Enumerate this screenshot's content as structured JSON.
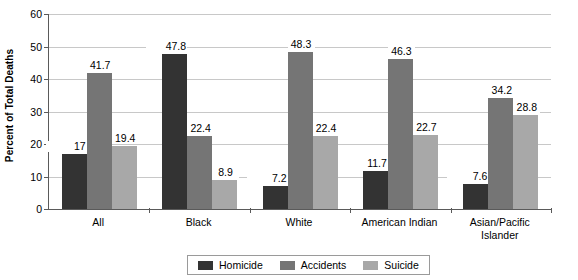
{
  "chart_data": {
    "type": "bar",
    "title": "",
    "subtitle": "",
    "xlabel": "",
    "ylabel": "Percent of Total Deaths",
    "ylim": [
      0,
      60
    ],
    "yticks": [
      0,
      10,
      20,
      30,
      40,
      50,
      60
    ],
    "grid": true,
    "grid_axis": "y",
    "legend_position": "bottom-center",
    "categories": [
      "All",
      "Black",
      "White",
      "American Indian",
      "Asian/Pacific Islander"
    ],
    "series": [
      {
        "name": "Homicide",
        "color": "#333333",
        "values": [
          17,
          47.8,
          7.2,
          11.7,
          7.6
        ],
        "labels": [
          "17",
          "47.8",
          "7.2",
          "11.7",
          "7.6"
        ]
      },
      {
        "name": "Accidents",
        "color": "#757575",
        "values": [
          41.7,
          22.4,
          48.3,
          46.3,
          34.2
        ],
        "labels": [
          "41.7",
          "22.4",
          "48.3",
          "46.3",
          "34.2"
        ]
      },
      {
        "name": "Suicide",
        "color": "#a8a8a8",
        "values": [
          19.4,
          8.9,
          22.4,
          22.7,
          28.8
        ],
        "labels": [
          "19.4",
          "8.9",
          "22.4",
          "22.7",
          "28.8"
        ]
      }
    ]
  },
  "axis": {
    "y_title": "Percent of Total Deaths",
    "y_tick_labels": [
      "60",
      "50",
      "40",
      "30",
      "20",
      "10",
      "0"
    ],
    "x_tick_labels": [
      {
        "lines": [
          "All"
        ]
      },
      {
        "lines": [
          "Black"
        ]
      },
      {
        "lines": [
          "White"
        ]
      },
      {
        "lines": [
          "American Indian"
        ]
      },
      {
        "lines": [
          "Asian/Pacific",
          "Islander"
        ]
      }
    ]
  },
  "legend": {
    "items": [
      {
        "label": "Homicide",
        "color": "#333333",
        "swatch_name": "legend-swatch-homicide"
      },
      {
        "label": "Accidents",
        "color": "#757575",
        "swatch_name": "legend-swatch-accidents"
      },
      {
        "label": "Suicide",
        "color": "#a8a8a8",
        "swatch_name": "legend-swatch-suicide"
      }
    ]
  },
  "colors": {
    "homicide": "#333333",
    "accidents": "#757575",
    "suicide": "#a8a8a8",
    "gridline": "#c8c8c8",
    "axis": "#5a5a5a",
    "background": "#ffffff",
    "text": "#000000"
  }
}
